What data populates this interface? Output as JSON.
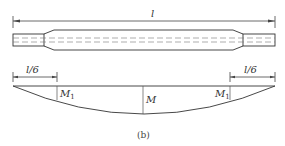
{
  "diagram": {
    "top": {
      "length_label": "l"
    },
    "bottom": {
      "left_segment_label": "l/6",
      "right_segment_label": "l/6",
      "left_moment_label": "M",
      "left_moment_sub": "1",
      "center_moment_label": "M",
      "right_moment_label": "M",
      "right_moment_sub": "1"
    },
    "caption": "(b)"
  }
}
